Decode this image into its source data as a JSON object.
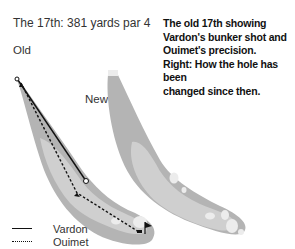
{
  "title": "The 17th: 381 yards par 4",
  "caption": {
    "lines": [
      "The old 17th showing",
      "Vardon's bunker shot and",
      "Ouimet's precision.",
      "Right: How the hole has been",
      "changed since then."
    ]
  },
  "labels": {
    "old": "Old",
    "new": "New"
  },
  "legend": [
    {
      "name": "Vardon",
      "style": "solid"
    },
    {
      "name": "Ouimet",
      "style": "dotted"
    }
  ],
  "colors": {
    "rough": "#b4b4b4",
    "fairway": "#cfcfcf",
    "bunker": "#ececec",
    "path": "#111111"
  }
}
